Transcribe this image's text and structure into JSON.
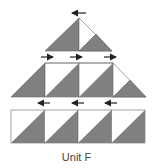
{
  "caption": "Unit F",
  "colors": {
    "dark": "#808080",
    "light": "#ffffff",
    "stroke": "#555555",
    "arrow": "#222222"
  },
  "rows": [
    {
      "name": "top-row",
      "units": 1,
      "pressing_arrows": [
        "left"
      ]
    },
    {
      "name": "middle-row",
      "units": 4,
      "pressing_arrows": [
        "right",
        "right",
        "right"
      ]
    },
    {
      "name": "bottom-row",
      "units": 4,
      "pressing_arrows": [
        "left",
        "left",
        "left"
      ]
    }
  ]
}
